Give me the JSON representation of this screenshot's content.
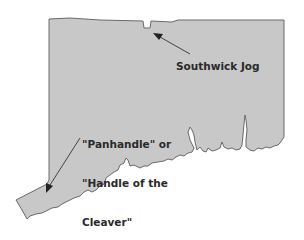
{
  "map": {
    "subject": "Connecticut outline",
    "fill_color": "#c8c8c8",
    "border_color": "#6a6a6a",
    "arrow_color": "#444444"
  },
  "annotations": {
    "southwick": {
      "label": "Southwick Jog"
    },
    "panhandle": {
      "line1": "\"Panhandle\" or",
      "line2": "\"Handle of the",
      "line3": "Cleaver\""
    }
  }
}
